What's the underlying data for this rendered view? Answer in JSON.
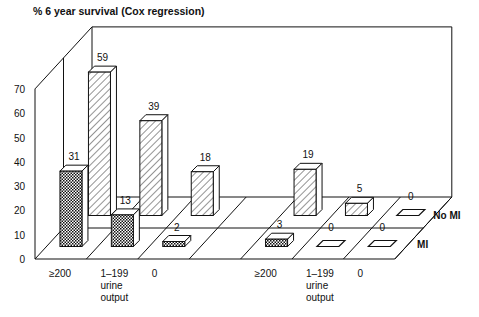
{
  "chart_data": {
    "type": "bar",
    "subtype": "3d-grouped",
    "title": "% 6 year survival (Cox regression)",
    "xlabel": "urine output",
    "ylabel": "% 6 year survival",
    "ylim": [
      0,
      70
    ],
    "yticks": [
      0,
      10,
      20,
      30,
      40,
      50,
      60,
      70
    ],
    "groups": [
      {
        "categories": [
          "≥200",
          "1–199\nurine\noutput",
          "0"
        ]
      },
      {
        "categories": [
          "≥200",
          "1–199\nurine\noutput",
          "0"
        ]
      }
    ],
    "categories": [
      "≥200",
      "1–199 urine output",
      "0",
      "",
      "≥200",
      "1–199 urine output",
      "0"
    ],
    "series": [
      {
        "name": "MI",
        "pattern": "dotted",
        "values": [
          31,
          13,
          2,
          null,
          3,
          0,
          0
        ]
      },
      {
        "name": "No MI",
        "pattern": "hatched",
        "values": [
          59,
          39,
          18,
          null,
          19,
          5,
          0
        ]
      }
    ],
    "legend_position": "right (row labels)",
    "grid": false
  },
  "labels": {
    "title": "% 6 year survival (Cox regression)",
    "row_front": "MI",
    "row_back": "No MI",
    "xcat": [
      [
        "≥200"
      ],
      [
        "1–199",
        "urine",
        "output"
      ],
      [
        "0"
      ],
      [],
      [
        "≥200"
      ],
      [
        "1–199",
        "urine",
        "output"
      ],
      [
        "0"
      ]
    ],
    "yticks": [
      "0",
      "10",
      "20",
      "30",
      "40",
      "50",
      "60",
      "70"
    ]
  },
  "colors": {
    "line": "#111111",
    "background": "#ffffff"
  }
}
